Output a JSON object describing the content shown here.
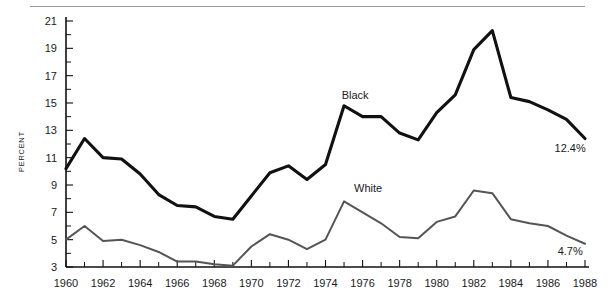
{
  "chart_data": {
    "type": "line",
    "title": "",
    "xlabel": "",
    "ylabel": "PERCENT",
    "xlim": [
      1960,
      1988
    ],
    "ylim": [
      3,
      21
    ],
    "grid": false,
    "legend": "inline-annotations",
    "x": [
      1960,
      1961,
      1962,
      1963,
      1964,
      1965,
      1966,
      1967,
      1968,
      1969,
      1970,
      1971,
      1972,
      1973,
      1974,
      1975,
      1976,
      1977,
      1978,
      1979,
      1980,
      1981,
      1982,
      1983,
      1984,
      1985,
      1986,
      1987,
      1988
    ],
    "x_tick_labels": [
      "1960",
      "1962",
      "1964",
      "1966",
      "1968",
      "1970",
      "1972",
      "1974",
      "1976",
      "1978",
      "1980",
      "1982",
      "1984",
      "1986",
      "1988"
    ],
    "y_tick_labels": [
      "3",
      "5",
      "7",
      "9",
      "11",
      "13",
      "15",
      "17",
      "19",
      "21"
    ],
    "series": [
      {
        "name": "Black",
        "color": "#111111",
        "label_text": "Black",
        "end_value_label": "12.4%",
        "values": [
          10.2,
          12.4,
          11.0,
          10.9,
          9.8,
          8.3,
          7.5,
          7.4,
          6.7,
          6.5,
          8.2,
          9.9,
          10.4,
          9.4,
          10.5,
          14.8,
          14.0,
          14.0,
          12.8,
          12.3,
          14.3,
          15.6,
          18.9,
          20.3,
          15.4,
          15.1,
          14.5,
          13.8,
          12.4
        ]
      },
      {
        "name": "White",
        "color": "#555555",
        "label_text": "White",
        "end_value_label": "4.7%",
        "values": [
          5.0,
          6.0,
          4.9,
          5.0,
          4.6,
          4.1,
          3.4,
          3.4,
          3.2,
          3.1,
          4.5,
          5.4,
          5.0,
          4.3,
          5.0,
          7.8,
          7.0,
          6.2,
          5.2,
          5.1,
          6.3,
          6.7,
          8.6,
          8.4,
          6.5,
          6.2,
          6.0,
          5.3,
          4.7
        ]
      }
    ],
    "annotations": [
      {
        "text": "Black",
        "x": 1975.6,
        "y": 15.3
      },
      {
        "text": "White",
        "x": 1976.3,
        "y": 8.5
      },
      {
        "text": "12.4%",
        "x": 1987.2,
        "y": 11.4
      },
      {
        "text": "4.7%",
        "x": 1987.2,
        "y": 3.9
      }
    ]
  }
}
